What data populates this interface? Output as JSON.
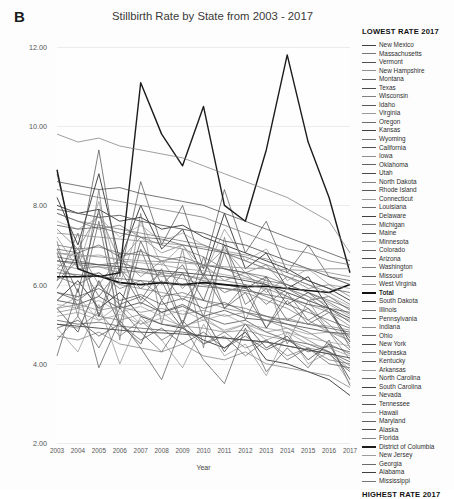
{
  "panel": {
    "letter": "B"
  },
  "chart_data": {
    "type": "line",
    "title": "Stillbirth Rate by State from 2003 - 2017",
    "xlabel": "Year",
    "ylabel": "Stillbirth rate (per 1,000 births)",
    "grid": true,
    "legend_position": "right",
    "legend_title_top": "LOWEST RATE 2017",
    "legend_title_bottom": "HIGHEST RATE 2017",
    "ylim": [
      2.0,
      12.0
    ],
    "yticks": [
      "2.00",
      "4.00",
      "6.00",
      "8.00",
      "10.00",
      "12.00"
    ],
    "ytick_values": [
      2.0,
      4.0,
      6.0,
      8.0,
      10.0,
      12.0
    ],
    "x": [
      2003,
      2004,
      2005,
      2006,
      2007,
      2008,
      2009,
      2010,
      2011,
      2012,
      2013,
      2014,
      2015,
      2016,
      2017
    ],
    "xticks": [
      "2003",
      "2004",
      "2005",
      "2006",
      "2007",
      "2008",
      "2009",
      "2010",
      "2011",
      "2012",
      "2013",
      "2014",
      "2015",
      "2016",
      "2017"
    ],
    "series": [
      {
        "name": "New Mexico",
        "values": [
          5.6,
          6.1,
          5.4,
          5.8,
          5.2,
          5.0,
          4.9,
          4.6,
          4.4,
          4.8,
          4.1,
          4.0,
          3.8,
          3.6,
          3.2
        ]
      },
      {
        "name": "Massachusetts",
        "values": [
          4.7,
          4.6,
          4.8,
          4.5,
          4.4,
          4.3,
          4.5,
          4.2,
          4.1,
          4.3,
          4.0,
          3.9,
          3.8,
          3.7,
          3.4
        ]
      },
      {
        "name": "Vermont",
        "values": [
          4.2,
          5.9,
          3.9,
          5.1,
          4.4,
          3.6,
          5.0,
          4.1,
          3.5,
          4.9,
          3.8,
          4.4,
          3.9,
          4.6,
          3.45
        ]
      },
      {
        "name": "New Hampshire",
        "values": [
          4.9,
          4.3,
          5.5,
          4.0,
          5.2,
          4.6,
          3.9,
          5.0,
          4.2,
          4.5,
          3.7,
          4.8,
          4.0,
          4.3,
          3.5
        ]
      },
      {
        "name": "Montana",
        "values": [
          5.4,
          4.8,
          6.1,
          5.0,
          4.5,
          5.6,
          4.9,
          5.2,
          4.3,
          5.0,
          4.4,
          4.7,
          4.1,
          4.5,
          3.6
        ]
      },
      {
        "name": "Texas",
        "values": [
          5.1,
          5.0,
          5.05,
          4.95,
          4.9,
          4.85,
          4.8,
          4.7,
          4.65,
          4.6,
          4.55,
          4.45,
          4.35,
          4.25,
          3.8
        ]
      },
      {
        "name": "Wisconsin",
        "values": [
          5.3,
          5.4,
          5.2,
          5.1,
          5.25,
          5.0,
          4.95,
          4.9,
          4.8,
          4.85,
          4.7,
          4.6,
          4.4,
          4.3,
          3.85
        ]
      },
      {
        "name": "Idaho",
        "values": [
          4.6,
          5.2,
          4.4,
          5.4,
          4.8,
          4.3,
          5.1,
          4.5,
          4.7,
          4.2,
          4.6,
          4.1,
          4.4,
          4.0,
          3.9
        ]
      },
      {
        "name": "Virginia",
        "values": [
          6.4,
          6.2,
          6.3,
          6.0,
          5.9,
          5.8,
          5.7,
          5.6,
          5.4,
          5.3,
          5.1,
          4.9,
          4.6,
          4.3,
          3.95
        ]
      },
      {
        "name": "Oregon",
        "values": [
          5.0,
          4.9,
          5.3,
          4.7,
          5.1,
          4.6,
          4.9,
          4.5,
          4.8,
          4.4,
          4.6,
          4.2,
          4.4,
          4.1,
          4.0
        ]
      },
      {
        "name": "Kansas",
        "values": [
          5.8,
          5.6,
          6.0,
          5.5,
          5.7,
          5.3,
          5.5,
          5.2,
          5.0,
          5.1,
          4.8,
          4.6,
          4.5,
          4.3,
          4.05
        ]
      },
      {
        "name": "Wyoming",
        "values": [
          7.1,
          5.2,
          8.4,
          4.6,
          7.8,
          5.0,
          6.9,
          4.4,
          7.2,
          5.1,
          6.2,
          4.5,
          5.6,
          4.8,
          4.1
        ]
      },
      {
        "name": "California",
        "values": [
          5.0,
          4.95,
          4.9,
          4.85,
          4.8,
          4.78,
          4.75,
          4.7,
          4.65,
          4.6,
          4.55,
          4.45,
          4.35,
          4.25,
          4.15
        ]
      },
      {
        "name": "Iowa",
        "values": [
          5.4,
          5.7,
          5.1,
          5.5,
          5.0,
          5.3,
          4.9,
          5.2,
          4.8,
          5.0,
          4.6,
          4.8,
          4.5,
          4.4,
          4.2
        ]
      },
      {
        "name": "Oklahoma",
        "values": [
          6.2,
          6.0,
          6.3,
          5.9,
          6.1,
          5.7,
          5.8,
          5.6,
          5.5,
          5.4,
          5.2,
          5.0,
          4.8,
          4.5,
          4.25
        ]
      },
      {
        "name": "Utah",
        "values": [
          4.9,
          5.1,
          4.7,
          5.0,
          4.6,
          4.9,
          4.5,
          4.8,
          4.4,
          4.7,
          4.35,
          4.6,
          4.3,
          4.45,
          4.3
        ]
      },
      {
        "name": "North Dakota",
        "values": [
          6.8,
          5.4,
          7.6,
          5.0,
          6.9,
          5.6,
          6.3,
          5.2,
          6.8,
          5.5,
          5.9,
          5.1,
          5.4,
          4.8,
          4.35
        ]
      },
      {
        "name": "Rhode Island",
        "values": [
          6.1,
          7.3,
          5.2,
          6.8,
          5.6,
          6.4,
          5.0,
          6.7,
          5.4,
          6.0,
          4.9,
          5.8,
          5.1,
          5.4,
          4.4
        ]
      },
      {
        "name": "Connecticut",
        "values": [
          5.5,
          5.4,
          5.6,
          5.3,
          5.45,
          5.2,
          5.35,
          5.1,
          5.25,
          5.0,
          4.9,
          4.8,
          4.65,
          4.55,
          4.45
        ]
      },
      {
        "name": "Louisiana",
        "values": [
          7.8,
          7.6,
          7.4,
          7.5,
          7.2,
          7.0,
          6.9,
          6.7,
          6.4,
          6.2,
          6.0,
          5.7,
          5.4,
          5.0,
          4.5
        ]
      },
      {
        "name": "Delaware",
        "values": [
          8.2,
          7.0,
          8.8,
          6.6,
          8.0,
          6.9,
          7.4,
          6.2,
          7.8,
          6.4,
          6.8,
          5.9,
          6.2,
          5.4,
          4.55
        ]
      },
      {
        "name": "Michigan",
        "values": [
          6.6,
          6.5,
          6.45,
          6.4,
          6.3,
          6.25,
          6.15,
          6.0,
          5.9,
          5.8,
          5.6,
          5.4,
          5.1,
          4.8,
          4.6
        ]
      },
      {
        "name": "Maine",
        "values": [
          5.9,
          6.8,
          5.2,
          6.4,
          5.5,
          6.1,
          5.0,
          6.3,
          5.4,
          5.8,
          4.9,
          5.6,
          5.0,
          5.3,
          4.65
        ]
      },
      {
        "name": "Minnesota",
        "values": [
          5.2,
          5.3,
          5.1,
          5.25,
          5.0,
          5.15,
          4.95,
          5.1,
          4.85,
          5.0,
          4.8,
          4.9,
          4.75,
          4.8,
          4.7
        ]
      },
      {
        "name": "Colorado",
        "values": [
          5.6,
          5.5,
          5.7,
          5.4,
          5.55,
          5.3,
          5.45,
          5.2,
          5.35,
          5.15,
          5.1,
          5.0,
          4.9,
          4.8,
          4.75
        ]
      },
      {
        "name": "Arizona",
        "values": [
          5.8,
          5.7,
          5.9,
          5.6,
          5.75,
          5.5,
          5.65,
          5.4,
          5.55,
          5.3,
          5.2,
          5.1,
          5.0,
          4.9,
          4.8
        ]
      },
      {
        "name": "Washington",
        "values": [
          5.4,
          5.5,
          5.35,
          5.45,
          5.3,
          5.4,
          5.25,
          5.35,
          5.2,
          5.3,
          5.1,
          5.15,
          5.0,
          4.95,
          4.85
        ]
      },
      {
        "name": "Missouri",
        "values": [
          6.7,
          6.6,
          6.5,
          6.55,
          6.4,
          6.3,
          6.25,
          6.1,
          6.0,
          5.9,
          5.7,
          5.5,
          5.3,
          5.1,
          4.9
        ]
      },
      {
        "name": "West Virginia",
        "values": [
          7.4,
          6.9,
          7.8,
          6.6,
          7.2,
          6.8,
          7.0,
          6.4,
          6.9,
          6.3,
          6.5,
          5.9,
          5.7,
          5.3,
          4.95
        ]
      },
      {
        "name": "Total",
        "values": [
          6.2,
          6.2,
          6.22,
          6.05,
          6.0,
          6.05,
          6.0,
          6.05,
          6.0,
          5.95,
          5.96,
          5.9,
          5.85,
          5.8,
          6.0
        ]
      },
      {
        "name": "South Dakota",
        "values": [
          6.9,
          5.8,
          7.9,
          5.4,
          7.1,
          6.0,
          6.5,
          5.6,
          7.0,
          5.9,
          6.2,
          5.5,
          5.8,
          5.4,
          5.05
        ]
      },
      {
        "name": "Illinois",
        "values": [
          6.5,
          6.4,
          6.45,
          6.3,
          6.35,
          6.2,
          6.25,
          6.15,
          6.1,
          6.0,
          5.9,
          5.7,
          5.5,
          5.3,
          5.1
        ]
      },
      {
        "name": "Pennsylvania",
        "values": [
          6.6,
          6.55,
          6.5,
          6.45,
          6.4,
          6.35,
          6.3,
          6.25,
          6.2,
          6.1,
          6.0,
          5.8,
          5.6,
          5.4,
          5.15
        ]
      },
      {
        "name": "Indiana",
        "values": [
          6.8,
          6.7,
          6.75,
          6.6,
          6.55,
          6.5,
          6.4,
          6.35,
          6.25,
          6.15,
          6.05,
          5.9,
          5.7,
          5.5,
          5.2
        ]
      },
      {
        "name": "Ohio",
        "values": [
          7.0,
          6.9,
          6.95,
          6.8,
          6.75,
          6.7,
          6.6,
          6.5,
          6.4,
          6.3,
          6.2,
          6.0,
          5.8,
          5.55,
          5.25
        ]
      },
      {
        "name": "New York",
        "values": [
          6.3,
          6.25,
          6.2,
          6.15,
          6.1,
          6.05,
          6.0,
          5.95,
          5.9,
          5.85,
          5.75,
          5.65,
          5.5,
          5.4,
          5.3
        ]
      },
      {
        "name": "Nebraska",
        "values": [
          6.1,
          6.6,
          5.7,
          6.4,
          5.9,
          6.3,
          5.6,
          6.2,
          5.8,
          6.0,
          5.5,
          5.9,
          5.6,
          5.7,
          5.35
        ]
      },
      {
        "name": "Kentucky",
        "values": [
          6.9,
          6.8,
          7.0,
          6.7,
          6.85,
          6.6,
          6.7,
          6.5,
          6.4,
          6.3,
          6.1,
          6.0,
          5.8,
          5.6,
          5.4
        ]
      },
      {
        "name": "Arkansas",
        "values": [
          7.6,
          7.4,
          7.7,
          7.2,
          7.5,
          7.1,
          7.3,
          7.0,
          6.8,
          6.6,
          6.4,
          6.2,
          6.0,
          5.7,
          5.45
        ]
      },
      {
        "name": "North Carolina",
        "values": [
          7.8,
          7.6,
          7.5,
          7.4,
          7.3,
          7.2,
          7.1,
          7.0,
          6.8,
          6.6,
          6.4,
          6.2,
          6.0,
          5.8,
          5.5
        ]
      },
      {
        "name": "South Carolina",
        "values": [
          8.0,
          7.8,
          7.9,
          7.6,
          7.7,
          7.4,
          7.5,
          7.2,
          7.0,
          6.8,
          6.6,
          6.4,
          6.1,
          5.9,
          5.6
        ]
      },
      {
        "name": "Nevada",
        "values": [
          6.4,
          6.9,
          6.0,
          6.7,
          6.2,
          6.6,
          5.9,
          6.5,
          6.1,
          6.3,
          5.8,
          6.2,
          5.9,
          6.0,
          5.7
        ]
      },
      {
        "name": "Tennessee",
        "values": [
          7.5,
          7.4,
          7.45,
          7.3,
          7.2,
          7.15,
          7.0,
          6.9,
          6.8,
          6.7,
          6.5,
          6.3,
          6.1,
          5.9,
          5.8
        ]
      },
      {
        "name": "Hawaii",
        "values": [
          7.2,
          6.4,
          8.1,
          6.0,
          7.6,
          6.5,
          7.0,
          6.2,
          7.4,
          6.6,
          6.9,
          6.1,
          6.4,
          6.0,
          5.9
        ]
      },
      {
        "name": "Maryland",
        "values": [
          7.9,
          7.8,
          7.7,
          7.75,
          7.6,
          7.5,
          7.4,
          7.3,
          7.1,
          7.0,
          6.8,
          6.6,
          6.4,
          6.2,
          6.0
        ]
      },
      {
        "name": "Alaska",
        "values": [
          8.8,
          6.6,
          9.4,
          6.2,
          8.6,
          7.0,
          8.0,
          6.4,
          8.4,
          6.8,
          7.6,
          6.3,
          7.0,
          6.2,
          6.1
        ]
      },
      {
        "name": "Florida",
        "values": [
          7.3,
          7.25,
          7.2,
          7.15,
          7.1,
          7.05,
          7.0,
          6.95,
          6.85,
          6.75,
          6.65,
          6.5,
          6.4,
          6.3,
          6.2
        ]
      },
      {
        "name": "District of Columbia",
        "values": [
          8.9,
          6.4,
          6.2,
          6.3,
          11.1,
          9.8,
          9.0,
          10.5,
          8.0,
          7.6,
          9.4,
          11.8,
          9.6,
          8.2,
          6.3
        ]
      },
      {
        "name": "New Jersey",
        "values": [
          6.8,
          6.75,
          6.7,
          6.65,
          6.6,
          6.58,
          6.55,
          6.5,
          6.45,
          6.42,
          6.4,
          6.38,
          6.35,
          6.4,
          6.4
        ]
      },
      {
        "name": "Georgia",
        "values": [
          8.4,
          8.3,
          8.2,
          8.1,
          8.0,
          7.9,
          7.8,
          7.7,
          7.5,
          7.3,
          7.1,
          6.9,
          6.8,
          6.6,
          6.5
        ]
      },
      {
        "name": "Alabama",
        "values": [
          8.6,
          8.5,
          8.4,
          8.45,
          8.3,
          8.2,
          8.1,
          8.0,
          7.8,
          7.6,
          7.4,
          7.2,
          7.0,
          6.8,
          6.6
        ]
      },
      {
        "name": "Mississippi",
        "values": [
          9.8,
          9.6,
          9.7,
          9.5,
          9.4,
          9.3,
          9.2,
          9.0,
          8.8,
          8.6,
          8.4,
          8.2,
          7.9,
          7.6,
          6.8
        ]
      }
    ]
  }
}
